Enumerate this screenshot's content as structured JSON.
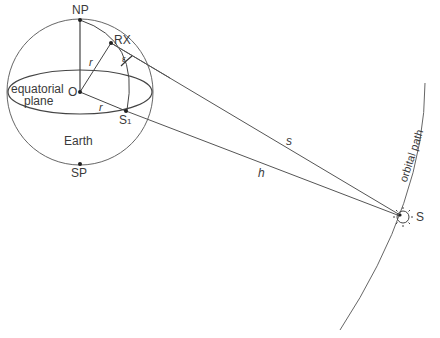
{
  "diagram": {
    "labels": {
      "north_pole": "NP",
      "south_pole": "SP",
      "receiver": "RX",
      "center": "O",
      "subpoint": "S",
      "subpoint_sub": "1",
      "earth": "Earth",
      "equatorial_plane_line1": "equatorial",
      "equatorial_plane_line2": "plane",
      "radius_1": "r",
      "radius_2": "r",
      "elevation_angle": "ε",
      "slant_range": "s",
      "altitude": "h",
      "satellite": "S",
      "orbital_path": "orbital path"
    },
    "colors": {
      "stroke": "#555555",
      "text": "#3a3a3a"
    }
  }
}
